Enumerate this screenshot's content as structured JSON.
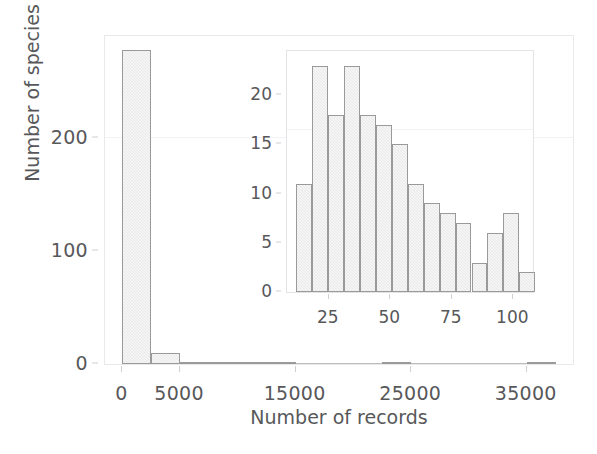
{
  "figure": {
    "caption_present": false,
    "background_color": "#ffffff",
    "bar_fill_color": "#e8e8e8",
    "bar_edge_color": "#9a9a9a",
    "axis_color": "#e9e9ec",
    "text_color": "#58585a"
  },
  "chart_data": [
    {
      "id": "main",
      "type": "bar",
      "title": "",
      "xlabel": "Number of records",
      "ylabel": "Number of species",
      "xlim": [
        -1500,
        39000
      ],
      "ylim": [
        0,
        290
      ],
      "xticks": [
        0,
        5000,
        15000,
        25000,
        35000
      ],
      "xticklabels": [
        "0",
        "5000",
        "15000",
        "25000",
        "35000"
      ],
      "yticks": [
        0,
        100,
        200
      ],
      "yticklabels": [
        "0",
        "100",
        "200"
      ],
      "grid": false,
      "legend": null,
      "bin_width": 2500,
      "bin_edges": [
        0,
        2500,
        5000,
        7500,
        10000,
        12500,
        15000,
        17500,
        20000,
        22500,
        25000,
        27500,
        30000,
        32500,
        35000,
        37500
      ],
      "categories": [
        "0-2500",
        "2500-5000",
        "5000-7500",
        "7500-10000",
        "10000-12500",
        "12500-15000",
        "15000-17500",
        "17500-20000",
        "20000-22500",
        "22500-25000",
        "25000-27500",
        "27500-30000",
        "30000-32500",
        "32500-35000",
        "35000-37500"
      ],
      "values": [
        278,
        10,
        2,
        2,
        2,
        1,
        0,
        0,
        0,
        1,
        0,
        0,
        0,
        0,
        1
      ]
    },
    {
      "id": "inset",
      "type": "bar",
      "title": "",
      "xlabel": "",
      "ylabel": "",
      "xlim": [
        8,
        108
      ],
      "ylim": [
        0,
        24.5
      ],
      "xticks": [
        25,
        50,
        75,
        100
      ],
      "xticklabels": [
        "25",
        "50",
        "75",
        "100"
      ],
      "yticks": [
        0,
        5,
        10,
        15,
        20
      ],
      "yticklabels": [
        "0",
        "5",
        "10",
        "15",
        "20"
      ],
      "grid": false,
      "legend": null,
      "bin_width": 6.5,
      "bin_edges": [
        11.5,
        18.0,
        24.5,
        31.0,
        37.5,
        44.0,
        50.5,
        57.0,
        63.5,
        70.0,
        76.5,
        83.0,
        89.5,
        96.0,
        102.5
      ],
      "categories": [
        "11.5-18",
        "18-24.5",
        "24.5-31",
        "31-37.5",
        "37.5-44",
        "44-50.5",
        "50.5-57",
        "57-63.5",
        "63.5-70",
        "70-76.5",
        "76.5-83",
        "83-89.5",
        "89.5-96",
        "96-102.5"
      ],
      "values": [
        11,
        23,
        18,
        23,
        18,
        17,
        15,
        11,
        9,
        8,
        7,
        3,
        6,
        8,
        2
      ]
    }
  ],
  "main_axis": {
    "ylabel": "Number of species",
    "xlabel": "Number of records",
    "yticks": [
      {
        "label": "0",
        "value": 0
      },
      {
        "label": "100",
        "value": 100
      },
      {
        "label": "200",
        "value": 200
      }
    ],
    "xticks": [
      {
        "label": "0",
        "value": 0
      },
      {
        "label": "5000",
        "value": 5000
      },
      {
        "label": "15000",
        "value": 15000
      },
      {
        "label": "25000",
        "value": 25000
      },
      {
        "label": "35000",
        "value": 35000
      }
    ]
  },
  "inset_axis": {
    "yticks": [
      {
        "label": "0",
        "value": 0
      },
      {
        "label": "5",
        "value": 5
      },
      {
        "label": "10",
        "value": 10
      },
      {
        "label": "15",
        "value": 15
      },
      {
        "label": "20",
        "value": 20
      }
    ],
    "xticks": [
      {
        "label": "25",
        "value": 25
      },
      {
        "label": "50",
        "value": 50
      },
      {
        "label": "75",
        "value": 75
      },
      {
        "label": "100",
        "value": 100
      }
    ]
  }
}
